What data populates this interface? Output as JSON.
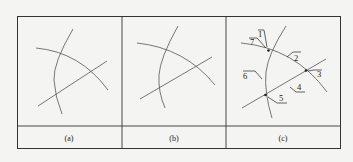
{
  "figure": {
    "panels": [
      {
        "id": "a",
        "caption": "(a)"
      },
      {
        "id": "b",
        "caption": "(b)"
      },
      {
        "id": "c",
        "caption": "(c)"
      }
    ],
    "callouts": [
      {
        "id": "1",
        "label": "1"
      },
      {
        "id": "7",
        "label": "7"
      },
      {
        "id": "2",
        "label": "2"
      },
      {
        "id": "3",
        "label": "3"
      },
      {
        "id": "4",
        "label": "4"
      },
      {
        "id": "5",
        "label": "5"
      },
      {
        "id": "6",
        "label": "6"
      }
    ],
    "colors": {
      "line": "#555555",
      "frame": "#333333",
      "background": "#f4f4f2"
    }
  }
}
